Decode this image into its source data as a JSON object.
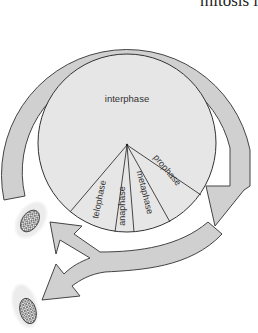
{
  "header_fragment": "mitosis is to",
  "diagram": {
    "center_label": "interphase",
    "phases": [
      {
        "label": "telophase"
      },
      {
        "label": "anaphase"
      },
      {
        "label": "metaphase"
      },
      {
        "label": "prophase"
      }
    ],
    "colors": {
      "ring": "#d0d0d0",
      "pie": "#e6e6e6",
      "stroke": "#444444",
      "cell_halo": "#e8e8e8",
      "nucleus": "#555555"
    },
    "cells": [
      {
        "name": "daughter-cell-1"
      },
      {
        "name": "daughter-cell-2"
      }
    ]
  }
}
